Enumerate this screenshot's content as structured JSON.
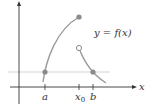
{
  "diagram": {
    "function_label": "y = f(x)",
    "x_axis_label": "x",
    "ticks": [
      {
        "label": "a",
        "sub": ""
      },
      {
        "label": "x",
        "sub": "0"
      },
      {
        "label": "b",
        "sub": ""
      }
    ],
    "colors": {
      "axis": "#333333",
      "curve": "#9a9a9a",
      "point_fill": "#8a8a8a",
      "horizontal_line": "#c8c8c8",
      "background": "#ffffff"
    },
    "points": [
      {
        "name": "left-endpoint",
        "type": "filled"
      },
      {
        "name": "jump-top",
        "type": "filled"
      },
      {
        "name": "jump-open",
        "type": "open"
      },
      {
        "name": "point-b",
        "type": "filled"
      }
    ]
  }
}
